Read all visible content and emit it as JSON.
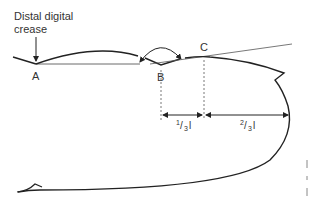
{
  "diagram": {
    "title_label": {
      "line1": "Distal digital",
      "line2": "crease"
    },
    "points": {
      "a": "A",
      "b": "B",
      "c": "C"
    },
    "dimensions": {
      "one_third_num": "1",
      "one_third_den": "3",
      "one_third_var": "l",
      "two_third_num": "2",
      "two_third_den": "3",
      "two_third_var": "l"
    },
    "colors": {
      "stroke": "#222222",
      "thin": "#444444",
      "text": "#333333"
    }
  }
}
